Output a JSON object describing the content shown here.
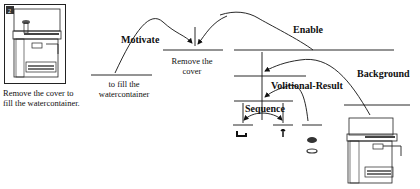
{
  "diagram": {
    "caption": {
      "line1": "Remove the cover to",
      "line2": "fill the watercontainer."
    },
    "relations": {
      "motivate": "Motivate",
      "enable": "Enable",
      "background": "Background",
      "volitional_result": "Volitional-Result",
      "sequence": "Sequence"
    },
    "nodes": {
      "fill": {
        "line1": "to fill the",
        "line2": "watercontainer"
      },
      "remove": {
        "line1": "Remove the",
        "line2": "cover"
      }
    },
    "icons": {
      "top_left": "espresso-machine-image",
      "bottom_right": "espresso-machine-image",
      "seq_left": "cover-hook-icon",
      "seq_right": "arrow-up-icon",
      "result": "water-container-icon"
    },
    "colors": {
      "line": "#111111",
      "background": "#ffffff"
    }
  }
}
